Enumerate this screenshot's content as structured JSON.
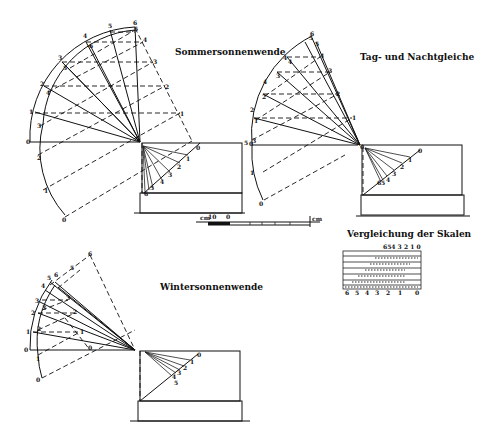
{
  "figure": {
    "panels": [
      {
        "id": "summer",
        "title": "Sommersonnenwende",
        "outer_arc_labels": [
          "0",
          "1",
          "2",
          "3",
          "4",
          "5",
          "6"
        ],
        "inner_arc_labels": [
          "0",
          "1",
          "2",
          "3",
          "4",
          "5"
        ],
        "projection_labels": [
          "0",
          "1",
          "2",
          "3",
          "4",
          "5"
        ],
        "dial_labels": [
          "0",
          "1",
          "2",
          "3",
          "4",
          "5",
          "6"
        ]
      },
      {
        "id": "equinox",
        "title": "Tag- und Nachtgleiche",
        "outer_arc_labels": [
          "0",
          "1",
          "2",
          "3",
          "4",
          "5",
          "6"
        ],
        "inner_arc_labels": [
          "0",
          "1",
          "2",
          "3",
          "4",
          "5"
        ],
        "projection_labels": [
          "1",
          "2",
          "3",
          "4",
          "5",
          "6"
        ],
        "dial_labels": [
          "0",
          "1",
          "2",
          "3",
          "4",
          "5",
          "6"
        ]
      },
      {
        "id": "winter",
        "title": "Wintersonnenwende",
        "outer_arc_labels": [
          "0",
          "1",
          "2",
          "3",
          "4",
          "5",
          "6"
        ],
        "inner_arc_labels": [
          "0",
          "1",
          "2",
          "3",
          "4",
          "5"
        ],
        "projection_labels": [
          "0",
          "1",
          "2",
          "3",
          "4",
          "5",
          "6"
        ],
        "dial_labels": [
          "0",
          "1",
          "2",
          "3",
          "4",
          "5",
          "6"
        ]
      }
    ],
    "scale_bar": {
      "left_label": "10",
      "mid_label": "0",
      "unit_left": "cm",
      "unit_right": "cm"
    },
    "comparison": {
      "title": "Vergleichung der Skalen",
      "top_labels": "654 3 2   1   0",
      "bottom_labels": [
        "6",
        "5",
        "4",
        "3",
        "2",
        "1",
        "0"
      ]
    }
  }
}
